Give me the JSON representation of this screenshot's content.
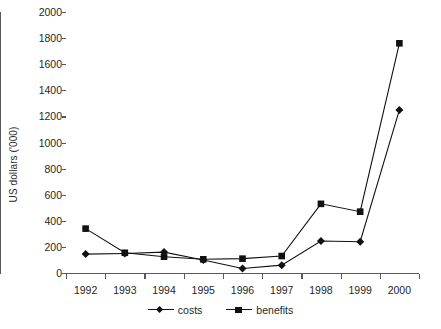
{
  "chart_data": {
    "type": "line",
    "title": "",
    "xlabel": "",
    "ylabel": "US dollars ('000)",
    "categories": [
      "1992",
      "1993",
      "1994",
      "1995",
      "1996",
      "1997",
      "1998",
      "1999",
      "2000"
    ],
    "ylim": [
      0,
      2000
    ],
    "y_ticks": [
      0,
      200,
      400,
      600,
      800,
      1000,
      1200,
      1400,
      1600,
      1800,
      2000
    ],
    "y_tick_labels": [
      "0",
      "200",
      "400",
      "600",
      "800",
      "1000",
      "1200",
      "1400",
      "1600",
      "1800",
      "2000"
    ],
    "grid": false,
    "legend_position": "bottom",
    "series": [
      {
        "name": "costs",
        "marker": "diamond",
        "color": "#111111",
        "values": [
          145,
          150,
          160,
          100,
          35,
          60,
          245,
          240,
          1250
        ]
      },
      {
        "name": "benefits",
        "marker": "square",
        "color": "#111111",
        "values": [
          340,
          155,
          125,
          105,
          110,
          130,
          530,
          470,
          1760
        ]
      }
    ]
  },
  "legend": {
    "entries": [
      {
        "label": "costs"
      },
      {
        "label": "benefits"
      }
    ]
  }
}
